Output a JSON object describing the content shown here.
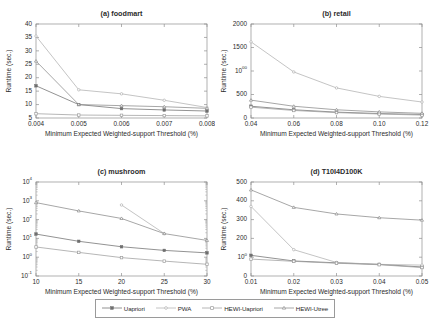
{
  "figure": {
    "common_xlabel": "Minimum Expected Weighted-support Threshold (%)",
    "common_ylabel": "Runtime (sec.)"
  },
  "legend": {
    "position": "bottom-center",
    "entries": [
      {
        "label": "Uapriori",
        "marker": "filled-square",
        "color": "#7a7a7a"
      },
      {
        "label": "PWA",
        "marker": "open-circle",
        "color": "#a8a8a8"
      },
      {
        "label": "HEWI-Uapriori",
        "marker": "open-square",
        "color": "#9a9a9a"
      },
      {
        "label": "HEWI-Utree",
        "marker": "open-triangle",
        "color": "#8c8c8c"
      }
    ]
  },
  "chart_data": [
    {
      "type": "line",
      "id": "a",
      "title": "(a) foodmart",
      "xlabel": "Minimum Expected Weighted-support Threshold (%)",
      "ylabel": "Runtime (sec.)",
      "xscale": "linear",
      "yscale": "linear",
      "x": [
        0.004,
        0.005,
        0.006,
        0.007,
        0.008
      ],
      "xticklabels": [
        "0.004",
        "0.005",
        "0.006",
        "0.007",
        "0.008"
      ],
      "yticklabels": [
        "5",
        "10",
        "15",
        "20",
        "25",
        "30",
        "35",
        "40"
      ],
      "xlim": [
        0.004,
        0.008
      ],
      "ylim": [
        5,
        40
      ],
      "grid": false,
      "series": [
        {
          "name": "Uapriori",
          "values": [
            17.0,
            10.0,
            8.5,
            8.0,
            7.6
          ]
        },
        {
          "name": "PWA",
          "values": [
            35.5,
            15.5,
            14.0,
            11.6,
            8.9
          ]
        },
        {
          "name": "HEWI-Uapriori",
          "values": [
            6.6,
            6.1,
            6.0,
            5.9,
            5.8
          ]
        },
        {
          "name": "HEWI-Utree",
          "values": [
            26.2,
            10.0,
            9.6,
            9.2,
            8.6
          ]
        }
      ]
    },
    {
      "type": "line",
      "id": "b",
      "title": "(b) retail",
      "xlabel": "Minimum Expected Weighted-support Threshold (%)",
      "ylabel": "Runtime (sec.)",
      "xscale": "linear",
      "yscale": "linear",
      "x": [
        0.04,
        0.06,
        0.08,
        0.1,
        0.12
      ],
      "xticklabels": [
        "0.04",
        "0.06",
        "0.08",
        "0.10",
        "0.12"
      ],
      "yticklabels": [
        "0",
        "500",
        "1000",
        "1500",
        "2000"
      ],
      "xlim": [
        0.04,
        0.12
      ],
      "ylim": [
        0,
        2000
      ],
      "grid": false,
      "series": [
        {
          "name": "Uapriori",
          "values": [
            250,
            175,
            125,
            95,
            75
          ]
        },
        {
          "name": "PWA",
          "values": [
            1620,
            980,
            640,
            460,
            340
          ]
        },
        {
          "name": "HEWI-Uapriori",
          "values": [
            230,
            160,
            115,
            85,
            62
          ]
        },
        {
          "name": "HEWI-Utree",
          "values": [
            380,
            250,
            175,
            130,
            100
          ]
        }
      ]
    },
    {
      "type": "line",
      "id": "c",
      "title": "(c) mushroom",
      "xlabel": "Minimum Expected Weighted-support Threshold (%)",
      "ylabel": "Runtime (sec.)",
      "xscale": "linear",
      "yscale": "log",
      "x": [
        10,
        15,
        20,
        25,
        30
      ],
      "xticklabels": [
        "10",
        "15",
        "20",
        "25",
        "30"
      ],
      "yticklabels": [
        "10-1",
        "100",
        "101",
        "102",
        "103",
        "104"
      ],
      "xlim": [
        10,
        30
      ],
      "ylim": [
        0.1,
        10000
      ],
      "grid": false,
      "series": [
        {
          "name": "Uapriori",
          "values": [
            17.0,
            7.0,
            3.6,
            2.3,
            1.7
          ]
        },
        {
          "name": "PWA",
          "values": [
            null,
            null,
            600,
            18.0,
            null
          ]
        },
        {
          "name": "HEWI-Uapriori",
          "values": [
            3.5,
            1.8,
            0.95,
            0.62,
            0.42
          ]
        },
        {
          "name": "HEWI-Utree",
          "values": [
            800,
            290,
            115,
            18.0,
            7.8
          ]
        }
      ]
    },
    {
      "type": "line",
      "id": "d",
      "title": "(d) T10I4D100K",
      "xlabel": "Minimum Expected Weighted-support Threshold (%)",
      "ylabel": "Runtime (sec.)",
      "xscale": "linear",
      "yscale": "linear",
      "x": [
        0.01,
        0.02,
        0.03,
        0.04,
        0.05
      ],
      "xticklabels": [
        "0.01",
        "0.02",
        "0.03",
        "0.04",
        "0.05"
      ],
      "yticklabels": [
        "0",
        "100",
        "200",
        "300",
        "400",
        "500"
      ],
      "xlim": [
        0.01,
        0.05
      ],
      "ylim": [
        0,
        500
      ],
      "grid": false,
      "series": [
        {
          "name": "Uapriori",
          "values": [
            110,
            80,
            70,
            62,
            48
          ]
        },
        {
          "name": "PWA",
          "values": [
            370,
            140,
            72,
            62,
            58
          ]
        },
        {
          "name": "HEWI-Uapriori",
          "values": [
            90,
            78,
            68,
            60,
            45
          ]
        },
        {
          "name": "HEWI-Utree",
          "values": [
            458,
            365,
            330,
            310,
            297
          ]
        }
      ]
    }
  ]
}
